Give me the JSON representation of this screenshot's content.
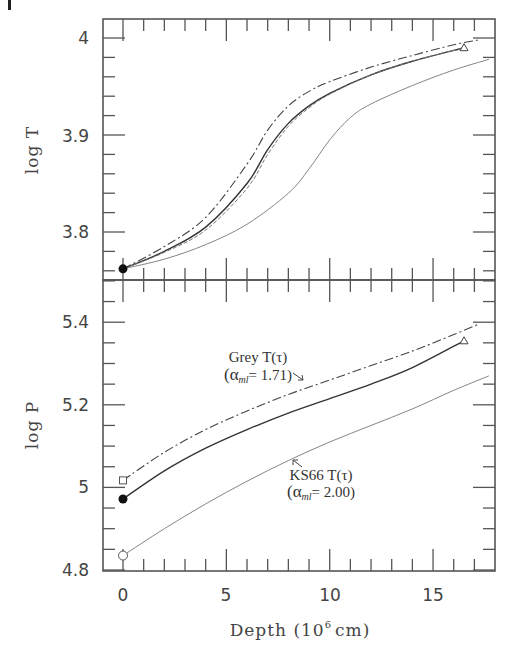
{
  "figure": {
    "corner_mark": "|",
    "x_axis": {
      "label": "Depth (10^6 cm)",
      "label_main": "Depth (10",
      "label_sup": "6",
      "label_end": "cm)",
      "ticks": [
        0,
        5,
        10,
        15
      ],
      "tick_labels": [
        "0",
        "5",
        "10",
        "15"
      ],
      "range": [
        -1,
        18
      ]
    },
    "top_panel": {
      "ylabel": "log T",
      "ticks": [
        3.8,
        3.9,
        4.0
      ],
      "tick_labels": [
        "3.8",
        "3.9",
        "4"
      ],
      "range": [
        3.755,
        4.027
      ]
    },
    "bottom_panel": {
      "ylabel": "log P",
      "ticks": [
        4.8,
        5.0,
        5.2,
        5.4
      ],
      "tick_labels": [
        "4.8",
        "5",
        "5.2",
        "5.4"
      ],
      "range": [
        4.8,
        5.505
      ],
      "annotations": [
        {
          "line1": "Grey T(τ)",
          "line2_prefix": "(α",
          "line2_sub": "ml",
          "line2_suffix": "= 1.71)"
        },
        {
          "line1": "KS66 T(τ)",
          "line2_prefix": "(α",
          "line2_sub": "ml",
          "line2_suffix": "= 2.00)"
        }
      ]
    }
  },
  "chart_data": [
    {
      "type": "line",
      "title": "",
      "xlabel": "Depth (10^6 cm)",
      "ylabel": "log T",
      "xlim": [
        -1,
        18
      ],
      "ylim": [
        3.755,
        4.027
      ],
      "grid": false,
      "legend": "none (inline annotations in lower panel)",
      "series": [
        {
          "name": "Grey T(tau) (alpha_ml = 1.71)",
          "style": "dash-dot",
          "x": [
            0,
            2,
            4,
            6,
            7,
            8,
            9,
            10,
            12,
            14,
            16,
            17.2
          ],
          "y": [
            3.762,
            3.785,
            3.815,
            3.87,
            3.905,
            3.93,
            3.945,
            3.955,
            3.97,
            3.982,
            3.993,
            3.998
          ]
        },
        {
          "name": "Model (solid)",
          "style": "solid",
          "x": [
            0,
            2,
            4,
            6,
            7,
            8,
            9,
            10,
            12,
            14,
            16.5
          ],
          "y": [
            3.762,
            3.78,
            3.805,
            3.85,
            3.885,
            3.912,
            3.93,
            3.943,
            3.962,
            3.976,
            3.99
          ],
          "end_marker": "triangle"
        },
        {
          "name": "Model (dashed)",
          "style": "dashed",
          "x": [
            0,
            2,
            4,
            6,
            7,
            8,
            9,
            10,
            12,
            14,
            16.5
          ],
          "y": [
            3.762,
            3.779,
            3.802,
            3.845,
            3.88,
            3.909,
            3.928,
            3.942,
            3.962,
            3.976,
            3.99
          ]
        },
        {
          "name": "KS66 T(tau) (alpha_ml = 2.00)",
          "style": "dotted",
          "x": [
            0,
            2,
            4,
            6,
            8,
            9,
            10,
            11,
            12,
            14,
            16,
            17.7
          ],
          "y": [
            3.762,
            3.772,
            3.787,
            3.808,
            3.84,
            3.865,
            3.895,
            3.918,
            3.932,
            3.951,
            3.967,
            3.978
          ]
        }
      ],
      "markers": [
        {
          "x": 0,
          "y": 3.762,
          "shape": "filled-circle"
        },
        {
          "x": 16.5,
          "y": 3.99,
          "shape": "open-triangle"
        }
      ]
    },
    {
      "type": "line",
      "title": "",
      "xlabel": "Depth (10^6 cm)",
      "ylabel": "log P",
      "xlim": [
        -1,
        18
      ],
      "ylim": [
        4.8,
        5.505
      ],
      "grid": false,
      "series": [
        {
          "name": "Grey T(tau) (alpha_ml = 1.71)",
          "style": "dash-dot",
          "x": [
            0,
            2,
            4,
            6,
            8,
            10,
            12,
            14,
            16,
            17.2
          ],
          "y": [
            5.017,
            5.085,
            5.14,
            5.185,
            5.225,
            5.26,
            5.295,
            5.33,
            5.37,
            5.395
          ]
        },
        {
          "name": "Model (solid)",
          "style": "solid",
          "x": [
            0,
            2,
            4,
            6,
            8,
            10,
            12,
            14,
            16.5
          ],
          "y": [
            4.972,
            5.04,
            5.095,
            5.14,
            5.18,
            5.215,
            5.25,
            5.29,
            5.355
          ],
          "start_marker": "filled-circle",
          "end_marker": "triangle"
        },
        {
          "name": "KS66 T(tau) (alpha_ml = 2.00)",
          "style": "dotted",
          "x": [
            0,
            2,
            4,
            6,
            8,
            10,
            12,
            14,
            16,
            17.7
          ],
          "y": [
            4.835,
            4.9,
            4.96,
            5.015,
            5.065,
            5.11,
            5.15,
            5.19,
            5.235,
            5.27
          ]
        }
      ],
      "markers": [
        {
          "x": 0,
          "y": 5.017,
          "shape": "open-square"
        },
        {
          "x": 0,
          "y": 4.972,
          "shape": "filled-circle"
        },
        {
          "x": 0,
          "y": 4.835,
          "shape": "open-circle"
        },
        {
          "x": 16.5,
          "y": 5.355,
          "shape": "open-triangle"
        }
      ],
      "annotations": [
        {
          "text": "Grey T(τ) (αml = 1.71)",
          "arrow_to": "dash-dot curve"
        },
        {
          "text": "KS66 T(τ) (αml = 2.00)",
          "arrow_to": "dotted curve"
        }
      ]
    }
  ]
}
